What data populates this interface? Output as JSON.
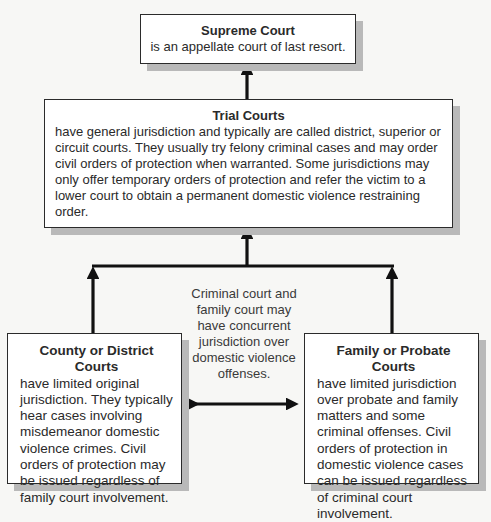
{
  "diagram": {
    "nodes": {
      "supreme": {
        "title": "Supreme Court",
        "text": "is an appellate court of last resort."
      },
      "trial": {
        "title": "Trial Courts",
        "text": "have general jurisdiction and typically are called district, superior or circuit courts. They usually try felony criminal cases and may order civil orders of protection when warranted. Some jurisdictions may only offer temporary orders of protection and refer the victim to a lower court to obtain a permanent domestic violence restraining order."
      },
      "county": {
        "title": "County or District Courts",
        "text": "have limited original jurisdiction. They typically hear cases involving misdemeanor domestic violence crimes. Civil orders of protection may be issued regardless of family court involvement."
      },
      "family": {
        "title": "Family or Probate Courts",
        "text": "have limited jurisdiction over probate and family matters and some criminal offenses. Civil orders of protection in domestic violence cases can be issued regardless of criminal court involvement."
      }
    },
    "middle_note": "Criminal court and family court may have concurrent jurisdiction over domestic violence offenses.",
    "edges": [
      {
        "from": "trial",
        "to": "supreme",
        "type": "arrow"
      },
      {
        "from": "county",
        "to": "trial",
        "type": "arrow"
      },
      {
        "from": "family",
        "to": "trial",
        "type": "arrow"
      },
      {
        "from": "county",
        "to": "family",
        "type": "double-arrow"
      }
    ],
    "colors": {
      "background": "#f7f7f5",
      "box_fill": "#ffffff",
      "box_border": "#2b2b2b",
      "shadow": "#b9b9b9",
      "arrow": "#111111"
    }
  }
}
